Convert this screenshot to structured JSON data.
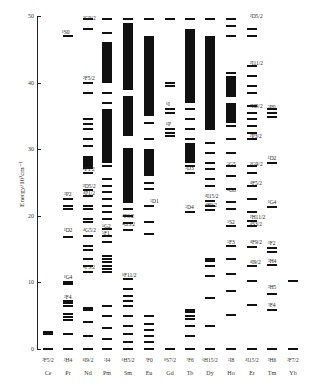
{
  "axis": {
    "ylabel": "Energy/10³cm⁻¹",
    "ticks": [
      "0",
      "10",
      "20",
      "30",
      "40",
      "50"
    ]
  },
  "ions": [
    {
      "name": "Ce",
      "ground": "²F5/2"
    },
    {
      "name": "Pr",
      "ground": "³H4"
    },
    {
      "name": "Nd",
      "ground": "⁴I9/2"
    },
    {
      "name": "Pm",
      "ground": "⁵I4"
    },
    {
      "name": "Sm",
      "ground": "⁶H5/2"
    },
    {
      "name": "Eu",
      "ground": "⁷F0"
    },
    {
      "name": "Gd",
      "ground": "⁸S7/2"
    },
    {
      "name": "Tb",
      "ground": "⁷F6"
    },
    {
      "name": "Dy",
      "ground": "⁶H15/2"
    },
    {
      "name": "Ho",
      "ground": "⁵I8"
    },
    {
      "name": "Er",
      "ground": "⁴I15/2"
    },
    {
      "name": "Tm",
      "ground": "³H6"
    },
    {
      "name": "Yb",
      "ground": "²F7/2"
    }
  ],
  "terms": {
    "pr_1S0": "¹S0",
    "pr_3P2": "³P2",
    "pr_1D2": "¹D2",
    "pr_1G4": "¹G4",
    "pr_3F4": "³F4",
    "nd_2G": "²G9/2",
    "nd_2F": "²F5/2",
    "nd_2P": "²P1/2",
    "nd_2D": "²D5/2",
    "nd_4P": "⁴P1/2",
    "nd_4G": "⁴G5/2",
    "nd_4F": "⁴F3/2",
    "pm_5G": "⁵G2",
    "pm_5F": "⁵F1",
    "sm_4F": "⁴F3/2",
    "sm_4G": "⁴G5/2",
    "sm_6F": "⁶F11/2",
    "eu_5D1": "⁵D1",
    "gd_6I": "⁶I",
    "gd_6P": "⁶P",
    "tb_5D3": "⁵D3",
    "tb_5D4": "⁵D4",
    "dy_4F": "⁴F9/2",
    "dy_4I": "⁴I15/2",
    "ho_5G5": "⁵G5",
    "ho_5G6": "⁵G6",
    "ho_5F3": "⁵F3",
    "ho_5S2": "⁵S2",
    "er_2D": "²D5/2",
    "er_2I": "²I11/2",
    "er_2H": "²H9/2",
    "er_2P": "²P3/2",
    "er_2G": "²G9/2",
    "er_4F5": "⁴F5/2",
    "er_2H11": "²H11/2",
    "er_4S": "⁴S3/2",
    "er_4F9": "⁴F9/2",
    "er_4I": "⁴I9/2",
    "tm_3P0": "³P0",
    "tm_1D2": "¹D2",
    "tm_1G4": "¹G4",
    "tm_3F2": "³F2",
    "tm_3H4": "³H4",
    "tm_3H5": "³H5",
    "tm_3F4": "³F4"
  },
  "chart_data": {
    "type": "diagram",
    "ylabel": "Energy/10³cm⁻¹",
    "ylim": [
      0,
      50
    ],
    "yticks": [
      0,
      10,
      20,
      30,
      40,
      50
    ],
    "categories": [
      "Ce",
      "Pr",
      "Nd",
      "Pm",
      "Sm",
      "Eu",
      "Gd",
      "Tb",
      "Dy",
      "Ho",
      "Er",
      "Tm",
      "Yb"
    ],
    "levels_1e3_cm": {
      "Ce": [
        0,
        2.2,
        2.6
      ],
      "Pr": [
        0,
        2.3,
        4.3,
        4.8,
        5.2,
        6.4,
        6.9,
        7.2,
        9.8,
        10.0,
        16.8,
        21.0,
        21.4,
        22.5,
        47.0
      ],
      "Nd": [
        0,
        2.0,
        4.0,
        5.9,
        6.2,
        11.5,
        12.5,
        13.5,
        14.8,
        15.5,
        17.0,
        19.0,
        19.5,
        21.0,
        21.5,
        23.0,
        23.8,
        26.5,
        28.0,
        28.5,
        30.5,
        31.5,
        33.0,
        33.8,
        34.5,
        38.5,
        40.0,
        48.0,
        49.5
      ],
      "Pm": [
        0,
        1.5,
        3.2,
        5.0,
        6.5,
        11.5,
        12.0,
        12.5,
        13.0,
        13.5,
        14.0,
        16.0,
        17.0,
        18.0,
        19.5,
        20.5,
        21.5,
        22.5,
        23.5,
        24.5,
        25.5,
        27.5,
        30.0,
        33.0,
        35.0,
        37.0,
        38.5,
        40.5,
        42.5,
        46.0,
        47.5,
        49.5
      ],
      "Sm": [
        0,
        1.0,
        2.2,
        3.5,
        5.0,
        6.5,
        7.2,
        8.0,
        9.0,
        10.5,
        17.9,
        18.9,
        20.0,
        21.0,
        22.0,
        23.0,
        24.0,
        26.0,
        27.5,
        30.0,
        32.5,
        34.5,
        36.0,
        37.5,
        39.0,
        40.5,
        44.0,
        48.0,
        49.5
      ],
      "Eu": [
        0,
        1.0,
        1.9,
        2.8,
        3.8,
        5.0,
        17.3,
        19.0,
        21.5,
        24.0,
        25.0,
        27.5,
        31.5,
        34.0,
        37.5,
        40.0,
        45.0,
        49.5
      ],
      "Gd": [
        0,
        32.0,
        32.5,
        33.0,
        35.5,
        36.0,
        39.5,
        40.0,
        49.5
      ],
      "Tb": [
        0,
        2.0,
        3.5,
        4.5,
        5.0,
        5.5,
        5.8,
        20.5,
        26.5,
        27.5,
        28.5,
        30.0,
        31.5,
        33.0,
        34.5,
        36.0,
        37.5,
        40.0,
        41.5,
        44.0,
        47.0,
        49.5
      ],
      "Dy": [
        0,
        3.5,
        7.7,
        11.0,
        12.5,
        13.2,
        13.5,
        20.8,
        21.5,
        22.2,
        24.5,
        25.5,
        27.0,
        28.0,
        29.5,
        31.0,
        33.0,
        35.0,
        36.5,
        38.5,
        40.5,
        44.0,
        49.5
      ],
      "Ho": [
        0,
        5.1,
        8.7,
        11.2,
        13.5,
        15.5,
        18.5,
        21.0,
        22.0,
        24.0,
        26.0,
        27.5,
        29.5,
        31.5,
        33.5,
        35.0,
        38.0,
        40.0,
        41.5,
        47.0,
        48.5,
        49.5
      ],
      "Er": [
        0,
        6.6,
        10.2,
        12.4,
        15.3,
        18.5,
        19.2,
        20.5,
        22.5,
        24.5,
        26.5,
        27.5,
        31.5,
        32.5,
        33.5,
        34.5,
        35.5,
        36.5,
        38.5,
        39.5,
        41.0,
        42.5,
        47.0,
        48.0
      ],
      "Tm": [
        0,
        5.8,
        8.3,
        12.6,
        14.5,
        15.1,
        21.3,
        28.0,
        34.8,
        35.5,
        36.0
      ],
      "Yb": [
        0,
        10.2
      ]
    },
    "annotations_ground_terms": [
      "²F5/2",
      "³H4",
      "⁴I9/2",
      "⁵I4",
      "⁶H5/2",
      "⁷F0",
      "⁸S7/2",
      "⁷F6",
      "⁶H15/2",
      "⁵I8",
      "⁴I15/2",
      "³H6",
      "²F7/2"
    ]
  }
}
